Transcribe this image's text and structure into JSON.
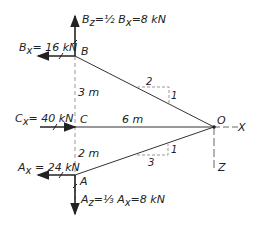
{
  "diagram": {
    "points": {
      "B": "B",
      "C": "C",
      "A": "A",
      "O": "O"
    },
    "axes": {
      "x": "X",
      "z": "Z"
    },
    "forces": {
      "Bz": "B",
      "Bz_sub": "z",
      "Bz_eq": "=½ B",
      "Bz_eq_sub": "x",
      "Bz_val": "=8 kN",
      "Bx": "B",
      "Bx_sub": "x",
      "Bx_val": "= 16 kN",
      "Cx": "C",
      "Cx_sub": "x",
      "Cx_val": "= 40 kN",
      "Ax": "A",
      "Ax_sub": "x",
      "Ax_val": " = 24 kN",
      "Az": "A",
      "Az_sub": "z",
      "Az_eq": "=⅓ A",
      "Az_eq_sub": "x",
      "Az_val": "=8 kN"
    },
    "dimensions": {
      "BC": "3 m",
      "CA": "2 m",
      "CO": "6 m"
    },
    "slopes": {
      "upper_run": "2",
      "upper_rise": "1",
      "lower_run": "3",
      "lower_rise": "1"
    }
  }
}
